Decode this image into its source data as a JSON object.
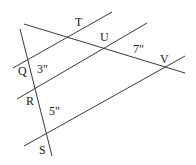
{
  "diagram": {
    "lines": {
      "parallel_top": {
        "x1": 13,
        "y1": 68,
        "x2": 112,
        "y2": 12
      },
      "parallel_middle": {
        "x1": 17,
        "y1": 99,
        "x2": 147,
        "y2": 23
      },
      "parallel_bottom": {
        "x1": 24,
        "y1": 146,
        "x2": 185,
        "y2": 56
      },
      "transversal_QS": {
        "x1": 20,
        "y1": 29,
        "x2": 52,
        "y2": 156
      },
      "transversal_TV": {
        "x1": 24,
        "y1": 24,
        "x2": 185,
        "y2": 73
      }
    },
    "points": {
      "T": "T",
      "U": "U",
      "V": "V",
      "Q": "Q",
      "R": "R",
      "S": "S"
    },
    "measurements": {
      "QR": "3\"",
      "RS": "5\"",
      "UV": "7\""
    },
    "line_color": "#3a3a3a"
  }
}
